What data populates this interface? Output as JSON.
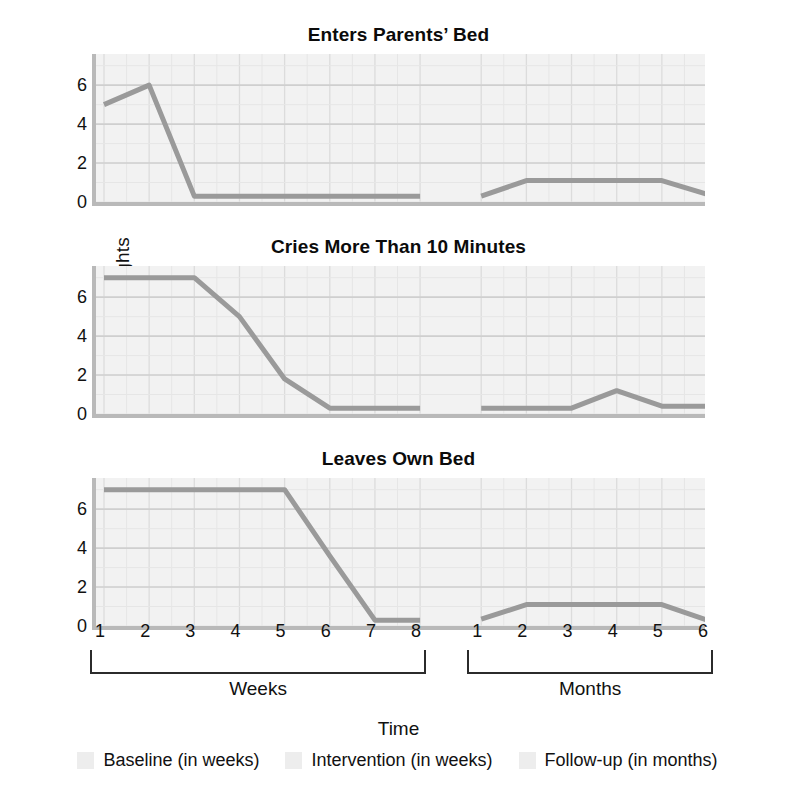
{
  "figure": {
    "y_axis_title": "Number of nights",
    "x_axis_title": "Time",
    "phase_brackets": [
      {
        "label": "Weeks",
        "start_index": 0,
        "end_index": 7
      },
      {
        "label": "Months",
        "start_index": 8,
        "end_index": 13
      }
    ],
    "legend": [
      {
        "label": "Baseline (in weeks)",
        "color": "#ededed"
      },
      {
        "label": "Intervention (in weeks)",
        "color": "#ededed"
      },
      {
        "label": "Follow-up (in months)",
        "color": "#ededed"
      }
    ],
    "line_color": "#9a9a9a",
    "plot_background": "#f2f2f2",
    "grid_color": "#dcdcdc",
    "axis_color": "#b9b9b9"
  },
  "chart_data": [
    {
      "type": "line",
      "title": "Enters Parents’ Bed",
      "xlabel": "Time",
      "ylabel": "Number of nights",
      "ylim": [
        0,
        7.6
      ],
      "yticks": [
        0,
        2,
        4,
        6
      ],
      "grid": true,
      "legend_position": "bottom",
      "categories": [
        "1",
        "2",
        "3",
        "4",
        "5",
        "6",
        "7",
        "8",
        "1",
        "2",
        "3",
        "4",
        "5",
        "6"
      ],
      "x_phase": [
        "Weeks",
        "Weeks",
        "Weeks",
        "Weeks",
        "Weeks",
        "Weeks",
        "Weeks",
        "Weeks",
        "Months",
        "Months",
        "Months",
        "Months",
        "Months",
        "Months"
      ],
      "values": [
        5,
        6,
        0.3,
        0.3,
        0.3,
        0.3,
        0.3,
        0.3,
        0.3,
        1.1,
        1.1,
        1.1,
        1.1,
        0.4
      ]
    },
    {
      "type": "line",
      "title": "Cries More Than 10 Minutes",
      "xlabel": "Time",
      "ylabel": "Number of nights",
      "ylim": [
        0,
        7.6
      ],
      "yticks": [
        0,
        2,
        4,
        6
      ],
      "grid": true,
      "legend_position": "bottom",
      "categories": [
        "1",
        "2",
        "3",
        "4",
        "5",
        "6",
        "7",
        "8",
        "1",
        "2",
        "3",
        "4",
        "5",
        "6"
      ],
      "x_phase": [
        "Weeks",
        "Weeks",
        "Weeks",
        "Weeks",
        "Weeks",
        "Weeks",
        "Weeks",
        "Weeks",
        "Months",
        "Months",
        "Months",
        "Months",
        "Months",
        "Months"
      ],
      "values": [
        7,
        7,
        7,
        5,
        1.8,
        0.3,
        0.3,
        0.3,
        0.3,
        0.3,
        0.3,
        1.2,
        0.4,
        0.4
      ]
    },
    {
      "type": "line",
      "title": "Leaves Own Bed",
      "xlabel": "Time",
      "ylabel": "Number of nights",
      "ylim": [
        0,
        7.6
      ],
      "yticks": [
        0,
        2,
        4,
        6
      ],
      "grid": true,
      "legend_position": "bottom",
      "categories": [
        "1",
        "2",
        "3",
        "4",
        "5",
        "6",
        "7",
        "8",
        "1",
        "2",
        "3",
        "4",
        "5",
        "6"
      ],
      "x_phase": [
        "Weeks",
        "Weeks",
        "Weeks",
        "Weeks",
        "Weeks",
        "Weeks",
        "Weeks",
        "Weeks",
        "Months",
        "Months",
        "Months",
        "Months",
        "Months",
        "Months"
      ],
      "values": [
        7,
        7,
        7,
        7,
        7,
        3.6,
        0.3,
        0.3,
        0.35,
        1.1,
        1.1,
        1.1,
        1.1,
        0.3
      ]
    }
  ]
}
